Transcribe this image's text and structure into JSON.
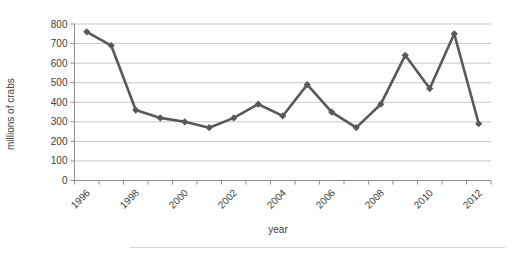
{
  "chart_data": {
    "type": "line",
    "title": "",
    "xlabel": "year",
    "ylabel": "millions of crabs",
    "x": [
      1996,
      1997,
      1998,
      1999,
      2000,
      2001,
      2002,
      2003,
      2004,
      2005,
      2006,
      2007,
      2008,
      2009,
      2010,
      2011,
      2012
    ],
    "values": [
      760,
      690,
      360,
      320,
      300,
      270,
      320,
      390,
      330,
      490,
      350,
      270,
      390,
      640,
      470,
      750,
      290
    ],
    "ylim": [
      0,
      800
    ],
    "ytick_interval": 100,
    "ytick_labels": [
      "0",
      "100",
      "200",
      "300",
      "400",
      "500",
      "600",
      "700",
      "800"
    ],
    "xtick_labels": [
      "1996",
      "1998",
      "2000",
      "2002",
      "2004",
      "2006",
      "2008",
      "2010",
      "2012"
    ],
    "xtick_label_every": 2,
    "grid": "horizontal",
    "legend": "none",
    "marker": "diamond",
    "colors": {
      "line": "#595959",
      "marker": "#595959",
      "gridline": "#c9c9c9",
      "axis": "#8f8f8f",
      "text": "#404040",
      "background": "#ffffff",
      "divider": "#d9d9d9"
    }
  }
}
